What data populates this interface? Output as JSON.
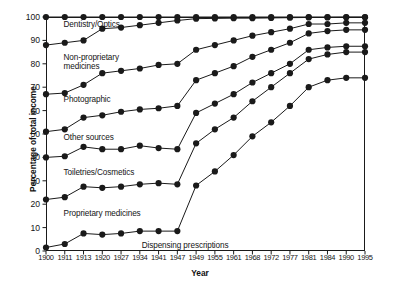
{
  "chart_data": {
    "type": "line",
    "title": "",
    "xlabel": "Year",
    "ylabel": "Percentage of total income",
    "ylim": [
      0,
      100
    ],
    "yticks": [
      0,
      10,
      20,
      30,
      40,
      50,
      60,
      70,
      80,
      90,
      100
    ],
    "grid": false,
    "legend_position": "inline-annotations",
    "categories": [
      "1900",
      "1911",
      "1913",
      "1920",
      "1927",
      "1934",
      "1941",
      "1947",
      "1949",
      "1955",
      "1961",
      "1968",
      "1972",
      "1977",
      "1981",
      "1984",
      "1990",
      "1995"
    ],
    "series": [
      {
        "name": "Dispensing prescriptions",
        "values": [
          1.5,
          3,
          7.5,
          7,
          7.5,
          8.5,
          8.5,
          8.5,
          28,
          34,
          41,
          49,
          55,
          62,
          70,
          73,
          74,
          74
        ]
      },
      {
        "name": "Proprietary medicines",
        "values": [
          22,
          23,
          27.5,
          27,
          27.5,
          28.5,
          29,
          28.5,
          46,
          52,
          57,
          64,
          70,
          76,
          82,
          84,
          85,
          85
        ]
      },
      {
        "name": "Toiletries/Cosmetics",
        "values": [
          40,
          40.5,
          44.5,
          43.5,
          43.5,
          45,
          44,
          43.5,
          59,
          63,
          67,
          72,
          76,
          80,
          86,
          87,
          87.5,
          87.5
        ]
      },
      {
        "name": "Other sources",
        "values": [
          51,
          52,
          57,
          58,
          59.5,
          60.5,
          61,
          62,
          73,
          76,
          79,
          83,
          86,
          89,
          93,
          94,
          94.5,
          94.5
        ]
      },
      {
        "name": "Photographic",
        "values": [
          67,
          67.5,
          71,
          76,
          77,
          78,
          79.5,
          80,
          86,
          88,
          90,
          92,
          93.5,
          95,
          97,
          97,
          97.5,
          97.5
        ]
      },
      {
        "name": "Non-proprietary medicines",
        "values": [
          88,
          89,
          90,
          95,
          95.5,
          96.5,
          97.5,
          98.5,
          99.3,
          99.4,
          99.5,
          99.5,
          99.6,
          99.7,
          99.8,
          99.8,
          99.9,
          99.9
        ]
      },
      {
        "name": "Dentistry/Optics",
        "values": [
          100,
          100,
          100,
          100,
          100,
          100,
          100,
          100,
          100,
          100,
          100,
          100,
          100,
          100,
          100,
          100,
          100,
          100
        ]
      }
    ],
    "annotations": [
      {
        "text": "Dentistry/Optics",
        "x_frac": 0.055,
        "y_value": 96.5
      },
      {
        "text": "Non-proprietary\nmedicines",
        "x_frac": 0.055,
        "y_value": 82.5
      },
      {
        "text": "Photographic",
        "x_frac": 0.055,
        "y_value": 64.5
      },
      {
        "text": "Other sources",
        "x_frac": 0.055,
        "y_value": 48.5
      },
      {
        "text": "Toiletries/Cosmetics",
        "x_frac": 0.055,
        "y_value": 33.5
      },
      {
        "text": "Proprietary medicines",
        "x_frac": 0.055,
        "y_value": 16.0
      },
      {
        "text": "Dispensing prescriptions",
        "x_frac": 0.3,
        "y_value": 2.0
      }
    ],
    "style": {
      "line_color": "#1a1a1a",
      "marker_color": "#1a1a1a",
      "marker_shape": "circle",
      "marker_size_px": 3.1,
      "line_width_px": 1.0,
      "background": "#ffffff",
      "axis_color": "#1a1a1a"
    }
  }
}
